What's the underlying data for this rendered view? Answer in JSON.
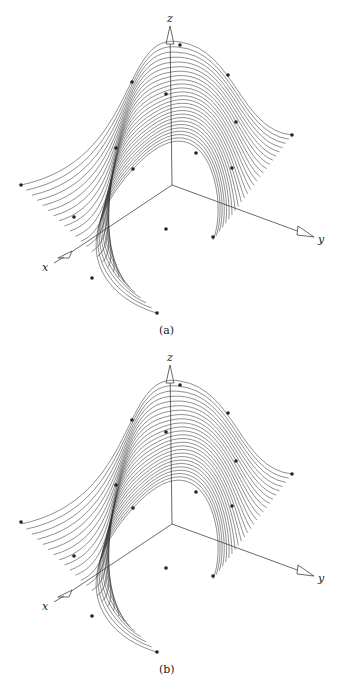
{
  "figure": {
    "panels": [
      {
        "id": "a",
        "caption": "(a)",
        "offset_y": 0,
        "axes": {
          "x_label": "x",
          "y_label": "y",
          "z_label": "z"
        },
        "control_points": [
          [
            21,
            185
          ],
          [
            74,
            217
          ],
          [
            92,
            278
          ],
          [
            157,
            313
          ],
          [
            116,
            148
          ],
          [
            133,
            169
          ],
          [
            132,
            82
          ],
          [
            166,
            94
          ],
          [
            180,
            45
          ],
          [
            228,
            75
          ],
          [
            236,
            122
          ],
          [
            292,
            135
          ],
          [
            196,
            153
          ],
          [
            232,
            168
          ],
          [
            166,
            229
          ],
          [
            213,
            237
          ]
        ]
      },
      {
        "id": "b",
        "caption": "(b)",
        "offset_y": 339,
        "axes": {
          "x_label": "x",
          "y_label": "y",
          "z_label": "z"
        },
        "control_points": [
          [
            21,
            183
          ],
          [
            74,
            217
          ],
          [
            92,
            277
          ],
          [
            157,
            313
          ],
          [
            116,
            146
          ],
          [
            133,
            169
          ],
          [
            132,
            81
          ],
          [
            166,
            93
          ],
          [
            180,
            46
          ],
          [
            228,
            74
          ],
          [
            236,
            122
          ],
          [
            292,
            135
          ],
          [
            196,
            153
          ],
          [
            232,
            167
          ],
          [
            166,
            229
          ],
          [
            213,
            237
          ]
        ]
      }
    ]
  },
  "chart_data": {
    "type": "surface-3d",
    "title": "",
    "panels": [
      "(a)",
      "(b)"
    ],
    "axis_labels": {
      "x": "x",
      "y": "y",
      "z": "z"
    }
  },
  "colors": {
    "line": "#333333",
    "point": "#222222",
    "axis": "#444444"
  }
}
